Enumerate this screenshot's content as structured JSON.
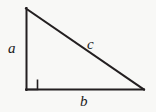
{
  "figure": {
    "name": "right-triangle",
    "background_color": "#f8f8f6",
    "stroke_color": "#231f20",
    "label_color": "#1a1a1a",
    "stroke_width": 2,
    "vertices": {
      "apex_top_left": [
        26,
        8
      ],
      "right_angle_bottom_left": [
        26,
        90
      ],
      "bottom_right": [
        144,
        90
      ]
    },
    "right_angle_marker": {
      "name": "right-angle-square",
      "x": 26,
      "y": 79,
      "size": 11
    },
    "labels": {
      "a": "a",
      "b": "b",
      "c": "c"
    },
    "label_meanings": {
      "a": "vertical leg",
      "b": "horizontal leg",
      "c": "hypotenuse"
    }
  }
}
